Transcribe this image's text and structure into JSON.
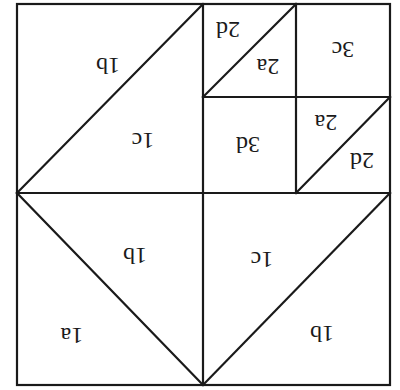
{
  "diagram": {
    "type": "quilt-block-piece-layout",
    "orientation": "rotated 180 degrees (labels upside down)",
    "frame": {
      "x1": 17,
      "y1": 4,
      "x2": 390,
      "y2": 385
    },
    "pieces": [
      {
        "id": "tl-upper",
        "label": "1b",
        "x": 108,
        "y": 66
      },
      {
        "id": "tl-lower",
        "label": "1c",
        "x": 143,
        "y": 141
      },
      {
        "id": "tr-a-upper",
        "label": "2d",
        "x": 228,
        "y": 30
      },
      {
        "id": "tr-a-lower",
        "label": "2a",
        "x": 268,
        "y": 67
      },
      {
        "id": "tr-b",
        "label": "3c",
        "x": 343,
        "y": 50
      },
      {
        "id": "tr-c",
        "label": "3d",
        "x": 248,
        "y": 145
      },
      {
        "id": "tr-d-upper",
        "label": "2a",
        "x": 326,
        "y": 123
      },
      {
        "id": "tr-d-lower",
        "label": "2d",
        "x": 362,
        "y": 161
      },
      {
        "id": "bl-upper",
        "label": "1b",
        "x": 135,
        "y": 256
      },
      {
        "id": "bl-lower",
        "label": "1a",
        "x": 72,
        "y": 336
      },
      {
        "id": "br-upper",
        "label": "1c",
        "x": 262,
        "y": 260
      },
      {
        "id": "br-lower",
        "label": "1b",
        "x": 322,
        "y": 334
      }
    ]
  }
}
